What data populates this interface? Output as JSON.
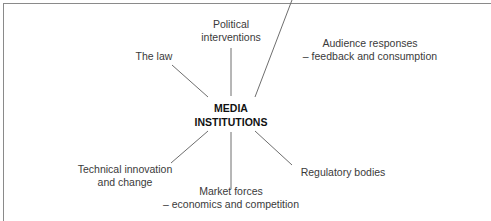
{
  "diagram": {
    "center": {
      "line1": "MEDIA",
      "line2": "INSTITUTIONS"
    },
    "nodes": [
      {
        "id": "political",
        "line1": "Political",
        "line2": "interventions"
      },
      {
        "id": "law",
        "line1": "The law",
        "line2": ""
      },
      {
        "id": "audience",
        "line1": "Audience responses",
        "line2": "– feedback and consumption"
      },
      {
        "id": "technical",
        "line1": "Technical innovation",
        "line2": "and change"
      },
      {
        "id": "market",
        "line1": "Market forces",
        "line2": "– economics and competition"
      },
      {
        "id": "regulatory",
        "line1": "Regulatory bodies",
        "line2": ""
      }
    ],
    "colors": {
      "line": "#6e6e6e",
      "text": "#333333",
      "frame": "#8a8a8a"
    }
  }
}
